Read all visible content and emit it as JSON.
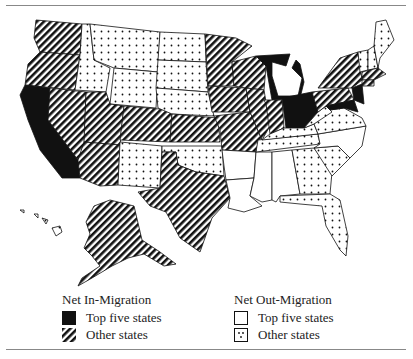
{
  "map": {
    "title": "",
    "colors": {
      "stroke": "#111111",
      "solid": "#111111",
      "background": "#ffffff"
    },
    "states": {
      "top_in": [
        "California",
        "Michigan",
        "Ohio",
        "New Jersey",
        "Maryland"
      ],
      "other_in": [
        "Washington",
        "Oregon",
        "Nevada",
        "Arizona",
        "Utah",
        "Colorado",
        "Kansas",
        "Nebraska (south)",
        "Missouri",
        "Iowa",
        "Minnesota",
        "Wisconsin",
        "Illinois",
        "Indiana",
        "Texas",
        "New York",
        "Pennsylvania",
        "Massachusetts",
        "Connecticut",
        "Alaska"
      ],
      "top_out": [
        "Arkansas",
        "Louisiana",
        "Mississippi",
        "Alabama",
        "North Carolina"
      ],
      "other_out": [
        "Idaho",
        "Montana",
        "Wyoming",
        "North Dakota",
        "South Dakota",
        "New Mexico",
        "Oklahoma",
        "Kentucky",
        "Tennessee",
        "West Virginia",
        "Virginia",
        "Georgia",
        "South Carolina",
        "Florida",
        "Maine",
        "Vermont",
        "New Hampshire",
        "Hawaii"
      ]
    }
  },
  "legend": {
    "in": {
      "title": "Net In-Migration",
      "items": [
        {
          "label": "Top five states",
          "pattern": "solid"
        },
        {
          "label": "Other states",
          "pattern": "hatch"
        }
      ]
    },
    "out": {
      "title": "Net Out-Migration",
      "items": [
        {
          "label": "Top five states",
          "pattern": "blank"
        },
        {
          "label": "Other states",
          "pattern": "dots"
        }
      ]
    }
  }
}
